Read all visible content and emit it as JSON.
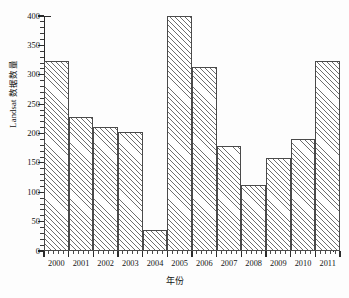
{
  "chart_data": {
    "type": "bar",
    "title": "",
    "subtitle": "",
    "xlabel": "年份",
    "ylabel": "Landsat 数据数量",
    "categories": [
      "2000",
      "2001",
      "2002",
      "2003",
      "2004",
      "2005",
      "2006",
      "2007",
      "2008",
      "2009",
      "2010",
      "2011"
    ],
    "values": [
      323,
      228,
      211,
      203,
      36,
      400,
      313,
      179,
      112,
      158,
      190,
      323
    ],
    "ylim": [
      0,
      400
    ],
    "ytick_labels": [
      "0",
      "50",
      "100",
      "150",
      "200",
      "250",
      "300",
      "350",
      "400"
    ],
    "ytick_values": [
      0,
      50,
      100,
      150,
      200,
      250,
      300,
      350,
      400
    ],
    "yminor_step": 10,
    "grid": false,
    "legend": null,
    "legend_position": "none",
    "series": [
      {
        "name": "Landsat 数据数量",
        "values": [
          323,
          228,
          211,
          203,
          36,
          400,
          313,
          179,
          112,
          158,
          190,
          323
        ]
      }
    ],
    "bar_style": {
      "fill": "#ffffff",
      "hatch": "diagonal-45",
      "hatch_color": "#6e6e6e",
      "edge_color": "#4a4a4a"
    },
    "axis_color": "#2b2b2b",
    "background": "#fdfdfd"
  }
}
